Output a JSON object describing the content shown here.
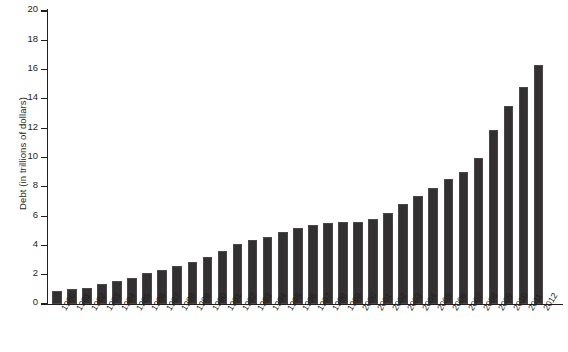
{
  "chart_data": {
    "type": "bar",
    "title": "",
    "subtitle": "",
    "xlabel": "",
    "ylabel": "Debt (in trillions of dollars)",
    "ylim": [
      0,
      20
    ],
    "ytick_step": 2,
    "yticks": [
      0,
      2,
      4,
      6,
      8,
      10,
      12,
      14,
      16,
      18,
      20
    ],
    "grid": false,
    "legend": "none",
    "bar_color": "#323031",
    "axis_color": "#231f20",
    "categories": [
      "1980",
      "1981",
      "1982",
      "1983",
      "1984",
      "1985",
      "1986",
      "1987",
      "1988",
      "1989",
      "1990",
      "1991",
      "1992",
      "1993",
      "1994",
      "1995",
      "1996",
      "1997",
      "1998",
      "1999",
      "2000",
      "2001",
      "2002",
      "2003",
      "2004",
      "2005",
      "2006",
      "2007",
      "2008",
      "2009",
      "2010",
      "2011",
      "2012"
    ],
    "values": [
      0.9,
      1.0,
      1.1,
      1.4,
      1.6,
      1.8,
      2.1,
      2.3,
      2.6,
      2.9,
      3.2,
      3.6,
      4.1,
      4.4,
      4.6,
      4.9,
      5.2,
      5.4,
      5.5,
      5.6,
      5.6,
      5.8,
      6.2,
      6.8,
      7.4,
      7.9,
      8.5,
      9.0,
      10.0,
      11.9,
      13.5,
      14.8,
      16.3
    ]
  }
}
